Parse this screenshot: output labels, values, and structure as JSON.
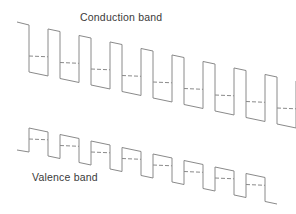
{
  "diagram": {
    "type": "superlattice band diagram",
    "labels": {
      "conduction": "Conduction band",
      "valence": "Valence band"
    },
    "colors": {
      "line": "#8a8a8a",
      "dash": "#8a8a8a",
      "text": "#3a3a3a"
    },
    "conduction_band": {
      "period_px": 31,
      "wells": 9,
      "start": [
        17,
        22
      ],
      "top_y_first": 25,
      "well_bottom_y_first": 72,
      "slope_px_per_period": 6.5,
      "well_width": 19,
      "barrier_width": 12,
      "dashed_level_offset": 16
    },
    "valence_band": {
      "period_px": 31,
      "wells": 8,
      "start": [
        17,
        150
      ],
      "top_y_first": 128,
      "bottom_y_first": 152,
      "slope_px_per_period": 6.5,
      "dashed_level_offset": 11
    }
  }
}
